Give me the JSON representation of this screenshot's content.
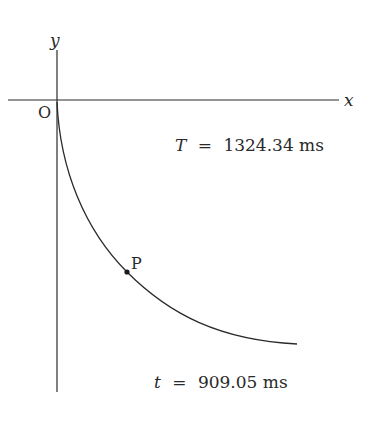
{
  "diagram": {
    "type": "brachistochrone-curve",
    "axes": {
      "x_label": "x",
      "y_label": "y",
      "origin_label": "O"
    },
    "point": {
      "label": "P"
    },
    "annotations": {
      "total_time": {
        "symbol": "T",
        "equals": "=",
        "value": "1324.34 ms"
      },
      "current_time": {
        "symbol": "t",
        "equals": "=",
        "value": "909.05 ms"
      }
    },
    "colors": {
      "ink": "#2a2a2a",
      "background": "#ffffff"
    }
  }
}
